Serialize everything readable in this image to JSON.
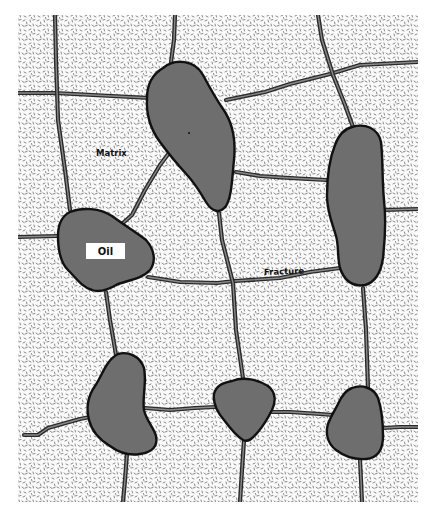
{
  "figure": {
    "colors": {
      "background": "#ffffff",
      "matrix_fill": "#fafafa",
      "matrix_stipple": "#6a6a6a",
      "oil": "#6e6e6e",
      "outline": "#111111",
      "label_box": "#ffffff"
    }
  },
  "labels": {
    "matrix": "Matrix",
    "oil": "Oil",
    "fracture": "Fracture"
  },
  "legend_items": [
    {
      "name": "matrix",
      "meaning": "stippled porous rock"
    },
    {
      "name": "oil",
      "meaning": "gray oil-filled vugs"
    },
    {
      "name": "fracture",
      "meaning": "double-line fracture channels"
    }
  ]
}
